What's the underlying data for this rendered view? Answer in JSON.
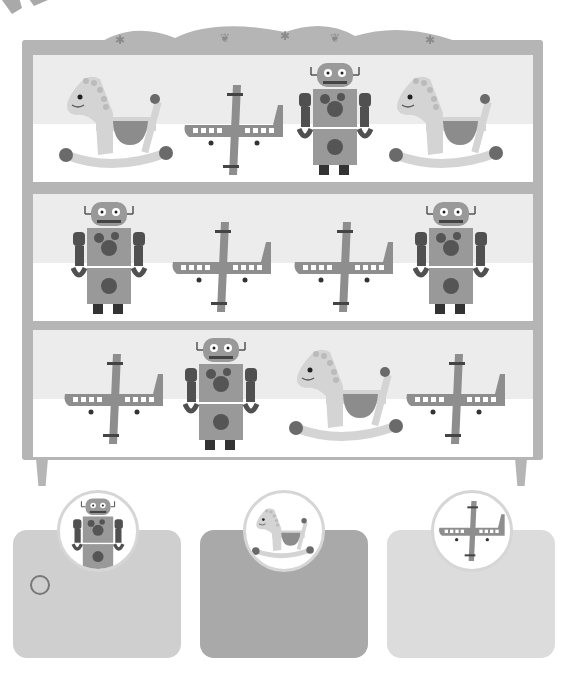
{
  "activity": {
    "type": "counting-worksheet",
    "shelf": {
      "rows": [
        {
          "items": [
            "rocking-horse",
            "airplane",
            "robot",
            "rocking-horse"
          ]
        },
        {
          "items": [
            "robot",
            "airplane",
            "airplane",
            "robot"
          ]
        },
        {
          "items": [
            "airplane",
            "robot",
            "rocking-horse",
            "airplane"
          ]
        }
      ]
    },
    "answer_cards": [
      {
        "toy": "robot",
        "marked_circle": true
      },
      {
        "toy": "rocking-horse",
        "marked_circle": false
      },
      {
        "toy": "airplane",
        "marked_circle": false
      }
    ]
  },
  "colors": {
    "shelf_frame": "#b5b5b5",
    "shelf_back_upper": "#ececec",
    "shelf_back_lower": "#ffffff",
    "card_robot": "#cfcfcf",
    "card_horse": "#a9a9a9",
    "card_plane": "#dcdcdc",
    "badge_border": "#d6d6d6"
  }
}
